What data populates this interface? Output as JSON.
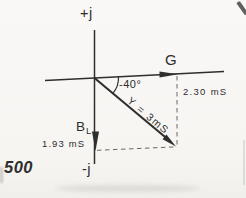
{
  "figure": {
    "page_number": "500",
    "imag_axis_top": "+j",
    "imag_axis_bottom": "-j",
    "real_axis_label": "G",
    "angle_label": "-40°",
    "admittance_label": "Y = 3mS",
    "conductance_value": "2.30 mS",
    "susceptance_symbol": "B",
    "susceptance_subscript": "L",
    "susceptance_value": "1.93 mS",
    "colors": {
      "ink": "#2e2e2e",
      "dash": "#6b6b6b",
      "paper": "#f7f6f4"
    }
  }
}
